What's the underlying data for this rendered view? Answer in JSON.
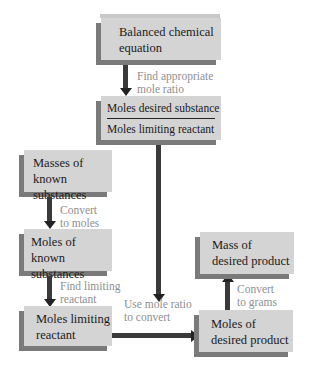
{
  "diagram": {
    "type": "flowchart",
    "boxes": {
      "balanced_equation": {
        "line1": "Balanced chemical",
        "line2": "equation"
      },
      "mole_ratio": {
        "numerator": "Moles desired substance",
        "denominator": "Moles limiting reactant"
      },
      "masses_known": {
        "line1": "Masses of",
        "line2": "known substances"
      },
      "moles_known": {
        "line1": "Moles of",
        "line2": "known substances"
      },
      "moles_limiting": {
        "line1": "Moles limiting",
        "line2": "reactant"
      },
      "moles_product": {
        "line1": "Moles of",
        "line2": "desired product"
      },
      "mass_product": {
        "line1": "Mass of",
        "line2": "desired product"
      }
    },
    "arrows": {
      "find_ratio": {
        "line1": "Find appropriate",
        "line2": "mole ratio"
      },
      "convert_moles": {
        "line1": "Convert",
        "line2": "to moles"
      },
      "find_limiting": {
        "line1": "Find limiting",
        "line2": "reactant"
      },
      "use_ratio": {
        "line1": "Use mole ratio",
        "line2": "to convert"
      },
      "convert_grams": {
        "line1": "Convert",
        "line2": "to grams"
      }
    },
    "colors": {
      "box_fill": "#d4d4d4",
      "box_shadow": "#7a7a7a",
      "arrow": "#3a3a3a",
      "label_text": "#8f8f8f",
      "box_text": "#1a1a1a"
    }
  }
}
